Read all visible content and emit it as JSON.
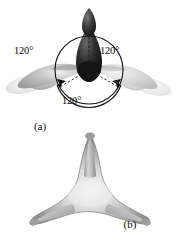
{
  "figure": {
    "background_color": "#ffffff"
  },
  "panel_a": {
    "caption": "(a)",
    "description": "Three sp2 hybrid orbitals drawn separately with bond angles marked",
    "angle_labels": {
      "left": "120°",
      "right": "120°",
      "bottom": "120°"
    },
    "colors": {
      "dark_lobe": "#1c1c1c",
      "mid_lobe": "#b6b6b6",
      "light_lobe": "#e3e3e3",
      "guide_circle": "#141414",
      "arrow": "#101010"
    }
  },
  "panel_b": {
    "caption": "(b)",
    "description": "Composite three-lobed sp2 hybrid orbital set",
    "colors": {
      "body_light": "#f2f2f2",
      "body_mid": "#b0b0b0",
      "body_dark": "#676767",
      "outline": "#7d7d7d"
    }
  }
}
